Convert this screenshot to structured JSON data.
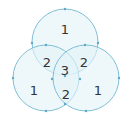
{
  "diagram": {
    "type": "venn",
    "colors": {
      "fill": "#e3f4f9",
      "stroke": "#7fbfd6",
      "dot": "#5fa8c8",
      "text": "#333333"
    },
    "circles": [
      {
        "name": "top",
        "cx": 65,
        "cy": 42,
        "r": 33
      },
      {
        "name": "left",
        "cx": 46,
        "cy": 78,
        "r": 33
      },
      {
        "name": "right",
        "cx": 86,
        "cy": 78,
        "r": 33
      }
    ],
    "regions": [
      {
        "name": "top-only",
        "label": "1",
        "x": 65,
        "y": 29
      },
      {
        "name": "top-left",
        "label": "2",
        "x": 47,
        "y": 62
      },
      {
        "name": "top-right",
        "label": "2",
        "x": 84,
        "y": 62
      },
      {
        "name": "center",
        "label": "3",
        "x": 65,
        "y": 70
      },
      {
        "name": "left-only",
        "label": "1",
        "x": 34,
        "y": 90
      },
      {
        "name": "left-right",
        "label": "2",
        "x": 66,
        "y": 94
      },
      {
        "name": "right-only",
        "label": "1",
        "x": 98,
        "y": 90
      }
    ],
    "dots": [
      [
        65,
        9
      ],
      [
        32,
        43
      ],
      [
        98,
        43
      ],
      [
        46,
        45
      ],
      [
        85,
        45
      ],
      [
        65,
        76
      ],
      [
        52,
        79
      ],
      [
        80,
        79
      ],
      [
        13,
        78
      ],
      [
        119,
        78
      ],
      [
        46,
        111
      ],
      [
        86,
        111
      ],
      [
        65,
        104
      ]
    ]
  }
}
